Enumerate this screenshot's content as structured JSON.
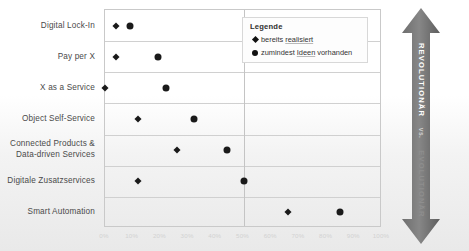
{
  "chart_data": {
    "type": "scatter",
    "title": "",
    "xlabel": "",
    "ylabel": "",
    "xlim": [
      0,
      100
    ],
    "grid": true,
    "legend_position": "top-right",
    "categories": [
      "Digital Lock-In",
      "Pay per X",
      "X as a Service",
      "Object Self-Service",
      "Connected Products &\nData-driven Services",
      "Digitale Zusatzservices",
      "Smart Automation"
    ],
    "xticks": [
      "0%",
      "10%",
      "20%",
      "30%",
      "40%",
      "50%",
      "60%",
      "70%",
      "80%",
      "90%",
      "100%"
    ],
    "xtick_values": [
      0,
      10,
      20,
      30,
      40,
      50,
      60,
      70,
      80,
      90,
      100
    ],
    "series": [
      {
        "name": "bereits realisiert",
        "marker": "diamond",
        "color": "#1a1a1a",
        "points": [
          {
            "category": "Digital Lock-In",
            "x": 4
          },
          {
            "category": "Pay per X",
            "x": 4
          },
          {
            "category": "X as a Service",
            "x": 0
          },
          {
            "category": "Object Self-Service",
            "x": 12
          },
          {
            "category": "Connected Products &\nData-driven Services",
            "x": 26
          },
          {
            "category": "Digitale Zusatzservices",
            "x": 12
          },
          {
            "category": "Smart Automation",
            "x": 66
          }
        ]
      },
      {
        "name": "zumindest Ideen vorhanden",
        "marker": "circle",
        "color": "#1a1a1a",
        "points": [
          {
            "category": "Digital Lock-In",
            "x": 9
          },
          {
            "category": "Pay per X",
            "x": 19
          },
          {
            "category": "X as a Service",
            "x": 22
          },
          {
            "category": "Object Self-Service",
            "x": 32
          },
          {
            "category": "Connected Products &\nData-driven Services",
            "x": 44
          },
          {
            "category": "Digitale Zusatzservices",
            "x": 50
          },
          {
            "category": "Smart Automation",
            "x": 85
          }
        ]
      }
    ]
  },
  "legend": {
    "title": "Legende",
    "items": [
      {
        "marker": "diamond",
        "label_pre": "bereits ",
        "label_underlined": "realisiert",
        "label_post": ""
      },
      {
        "marker": "circle",
        "label_pre": "zumindest ",
        "label_underlined": "Ideen",
        "label_post": " vorhanden"
      }
    ]
  },
  "axis_arrow": {
    "top_label": "REVOLUTIONÄR",
    "mid_label": "vs.",
    "bottom_label": "EVOLUTIONÄR",
    "direction": "double"
  }
}
